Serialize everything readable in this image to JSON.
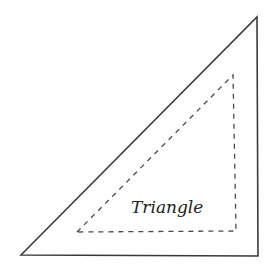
{
  "diagram": {
    "label": "Triangle",
    "colors": {
      "background": "#ffffff",
      "outer_stroke": "#3a3a3a",
      "inner_stroke": "#4a4a4a",
      "text": "#222222"
    },
    "outer_triangle": {
      "style": "solid",
      "points": [
        [
          21,
          255
        ],
        [
          257,
          17
        ],
        [
          258,
          256
        ]
      ]
    },
    "inner_triangle": {
      "style": "dashed",
      "points": [
        [
          77,
          232
        ],
        [
          233,
          75
        ],
        [
          236,
          231
        ]
      ]
    }
  }
}
